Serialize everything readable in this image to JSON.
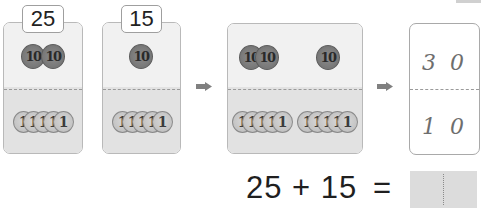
{
  "cards": [
    {
      "label": "25",
      "tens": [
        "10",
        "10"
      ],
      "ones": [
        "1",
        "1",
        "1",
        "1",
        "1"
      ]
    },
    {
      "label": "15",
      "tens": [
        "10"
      ],
      "ones": [
        "1",
        "1",
        "1",
        "1",
        "1"
      ]
    }
  ],
  "combined": {
    "tens_left": [
      "10",
      "10"
    ],
    "tens_right": [
      "10"
    ],
    "ones_left": [
      "1",
      "1",
      "1",
      "1",
      "1"
    ],
    "ones_right": [
      "1",
      "1",
      "1",
      "1",
      "1"
    ]
  },
  "result_card": {
    "top_tens": "3",
    "top_ones": "0",
    "bottom_tens": "1",
    "bottom_ones": "0"
  },
  "equation": {
    "expression": "25 + 15",
    "equals": "=",
    "answer": ""
  },
  "icons": {
    "arrow": "right-arrow-icon"
  },
  "colors": {
    "card_top": "#f1f1f1",
    "card_bottom": "#e2e2e2",
    "coin10": "#7a7a7a",
    "coin1": "#c4c4c4",
    "arrow": "#808080"
  }
}
